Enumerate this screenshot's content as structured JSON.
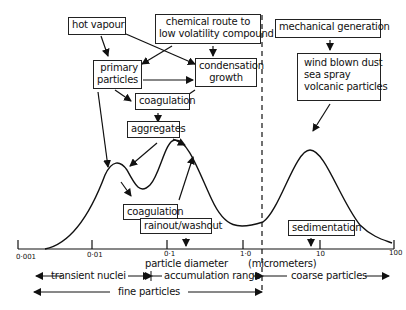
{
  "diagram": {
    "boxes": {
      "hot_vapour": "hot vapour",
      "chemical_route_line1": "chemical route to",
      "chemical_route_line2": "low volatility compound",
      "primary_particles_line1": "primary",
      "primary_particles_line2": "particles",
      "condensation_line1": "condensation",
      "condensation_line2": "growth",
      "coagulation_top": "coagulation",
      "aggregates": "aggregates",
      "coagulation_bottom": "coagulation",
      "rainout_washout": "rainout/washout",
      "mechanical_generation": "mechanical generation",
      "sources_line1": "wind blown dust",
      "sources_line2": "sea spray",
      "sources_line3": "volcanic particles",
      "sedimentation": "sedimentation"
    },
    "axis": {
      "ticks": [
        "0·001",
        "0·01",
        "0·1",
        "1·0",
        "10",
        "100"
      ],
      "label_left": "particle diameter",
      "label_right": "(micrometers)"
    },
    "ranges": {
      "transient_nuclei": "transient nuclei",
      "accumulation_range": "accumulation range",
      "coarse_particles": "coarse particles",
      "fine_particles": "fine particles"
    },
    "colors": {
      "ink": "#111111",
      "background": "#ffffff"
    }
  }
}
